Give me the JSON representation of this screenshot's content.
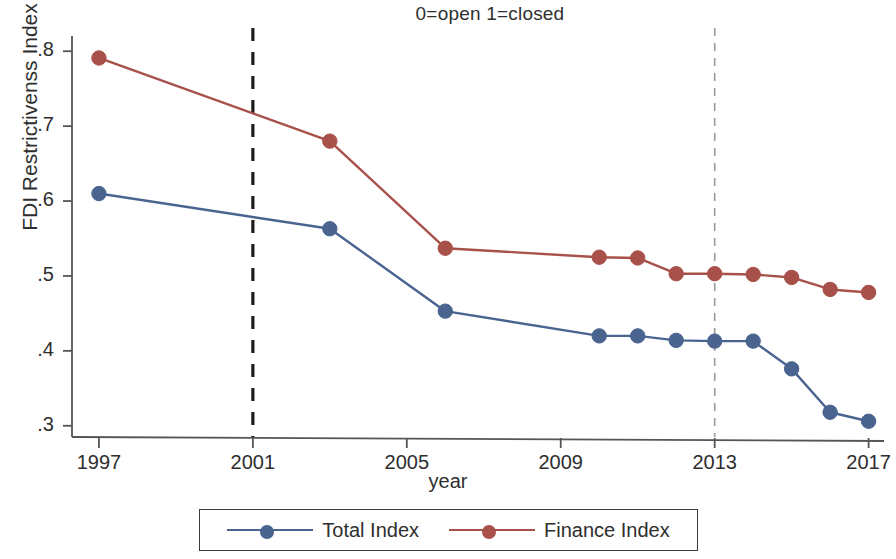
{
  "chart_data": {
    "type": "line",
    "title": "0=open 1=closed",
    "xlabel": "year",
    "ylabel": "FDI Restrictivenss Index",
    "x": [
      1997,
      2003,
      2006,
      2010,
      2011,
      2012,
      2013,
      2014,
      2015,
      2016,
      2017
    ],
    "xlim": [
      1996.3,
      2017.4
    ],
    "ylim": [
      0.285,
      0.815
    ],
    "xticks": [
      1997,
      2001,
      2005,
      2009,
      2013,
      2017
    ],
    "xtick_labels": [
      "1997",
      "2001",
      "2005",
      "2009",
      "2013",
      "2017"
    ],
    "yticks": [
      0.3,
      0.4,
      0.5,
      0.6,
      0.7,
      0.8
    ],
    "ytick_labels": [
      ".3",
      ".4",
      ".5",
      ".6",
      ".7",
      ".8"
    ],
    "grid": false,
    "legend_position": "bottom",
    "series": [
      {
        "name": "Total Index",
        "color": "#4a6490",
        "marker": "circle",
        "values": [
          0.61,
          0.563,
          0.453,
          0.42,
          0.42,
          0.414,
          0.413,
          0.413,
          0.376,
          0.318,
          0.306
        ]
      },
      {
        "name": "Finance Index",
        "color": "#a8504a",
        "marker": "circle",
        "values": [
          0.791,
          0.68,
          0.537,
          0.525,
          0.524,
          0.503,
          0.503,
          0.502,
          0.498,
          0.482,
          0.478
        ]
      }
    ],
    "annotations": [
      {
        "type": "vline",
        "x": 2001,
        "style": "dashed",
        "color": "#1d1d1d",
        "width": 3.2
      },
      {
        "type": "vline",
        "x": 2013,
        "style": "dashed",
        "color": "#9a9a9a",
        "width": 1.6
      }
    ]
  },
  "legend": {
    "entries": [
      {
        "label": "Total Index",
        "color": "#4a6490"
      },
      {
        "label": "Finance Index",
        "color": "#a8504a"
      }
    ]
  }
}
